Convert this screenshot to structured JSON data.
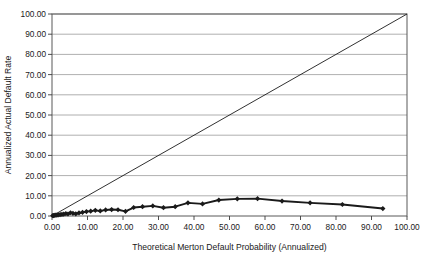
{
  "chart_data": {
    "type": "scatter",
    "title": "",
    "xlabel": "Theoretical Merton Default Probability (Annualized)",
    "ylabel": "Annualized Actual Default Rate",
    "xlim": [
      0,
      100
    ],
    "ylim": [
      0,
      100
    ],
    "grid": "horizontal",
    "legend": "none",
    "xticks": [
      "0.00",
      "10.00",
      "20.00",
      "30.00",
      "40.00",
      "50.00",
      "60.00",
      "70.00",
      "80.00",
      "90.00",
      "100.00"
    ],
    "yticks": [
      "0.00",
      "10.00",
      "20.00",
      "30.00",
      "40.00",
      "50.00",
      "60.00",
      "70.00",
      "80.00",
      "90.00",
      "100.00"
    ],
    "xtick_values": [
      0,
      10,
      20,
      30,
      40,
      50,
      60,
      70,
      80,
      90,
      100
    ],
    "ytick_values": [
      0,
      10,
      20,
      30,
      40,
      50,
      60,
      70,
      80,
      90,
      100
    ],
    "series": [
      {
        "name": "Annualized Actual Default Rate",
        "style": "line-with-diamond-markers",
        "color": "#1a1a1a",
        "x": [
          0.2,
          0.4,
          0.6,
          0.9,
          1.2,
          1.5,
          1.9,
          2.3,
          2.8,
          3.3,
          3.9,
          4.5,
          5.2,
          5.9,
          6.7,
          7.6,
          8.6,
          9.7,
          10.9,
          12.2,
          13.6,
          15.1,
          16.8,
          18.6,
          20.7,
          23.0,
          25.5,
          28.4,
          31.4,
          34.7,
          38.3,
          42.4,
          47.0,
          52.2,
          57.9,
          64.8,
          72.7,
          81.8,
          93.2
        ],
        "y": [
          0.15,
          0.2,
          0.3,
          0.4,
          0.45,
          0.5,
          0.6,
          0.7,
          0.8,
          0.9,
          1.2,
          1.0,
          1.6,
          1.3,
          1.1,
          1.5,
          1.8,
          2.2,
          2.4,
          2.8,
          2.5,
          3.0,
          3.2,
          3.1,
          2.3,
          4.2,
          4.6,
          5.0,
          4.1,
          4.6,
          6.5,
          6.0,
          7.9,
          8.5,
          8.6,
          7.4,
          6.5,
          5.7,
          3.7
        ]
      },
      {
        "name": "45-degree reference line",
        "style": "thin-line",
        "color": "#1a1a1a",
        "x": [
          0,
          100
        ],
        "y": [
          0,
          100
        ]
      }
    ]
  },
  "axis_titles": {
    "x": "Theoretical Merton Default Probability (Annualized)",
    "y": "Annualized Actual Default Rate"
  }
}
